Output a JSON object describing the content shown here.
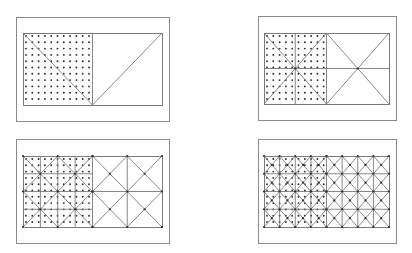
{
  "figure": {
    "colors": {
      "background": "#ffffff",
      "frame": "#8a8a8a",
      "lines": "#7a7a7a",
      "dots": "#2e2e2e"
    },
    "dot_spacing": 6.3,
    "panels": [
      {
        "id": "panel-1",
        "level": 0,
        "outer": {
          "x": 16,
          "y": 17,
          "w": 153,
          "h": 104
        },
        "inner": {
          "x": 23,
          "y": 33,
          "w": 139,
          "h": 72
        },
        "grid_divisions": 1,
        "diagonal_mode": "single-v"
      },
      {
        "id": "panel-2",
        "level": 1,
        "outer": {
          "x": 258,
          "y": 16,
          "w": 138,
          "h": 104
        },
        "inner": {
          "x": 264,
          "y": 33,
          "w": 125,
          "h": 71
        },
        "grid_divisions": 1,
        "diagonal_mode": "x-per-cell"
      },
      {
        "id": "panel-3",
        "level": 2,
        "outer": {
          "x": 16,
          "y": 139,
          "w": 153,
          "h": 104
        },
        "inner": {
          "x": 23,
          "y": 156,
          "w": 139,
          "h": 71
        },
        "grid_divisions": 2,
        "diagonal_mode": "x-per-cell"
      },
      {
        "id": "panel-4",
        "level": 3,
        "outer": {
          "x": 258,
          "y": 139,
          "w": 138,
          "h": 104
        },
        "inner": {
          "x": 264,
          "y": 156,
          "w": 125,
          "h": 71
        },
        "grid_divisions": 4,
        "diagonal_mode": "x-per-cell"
      }
    ]
  }
}
